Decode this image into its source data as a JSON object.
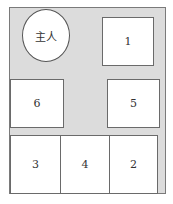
{
  "diagram": {
    "host_label": "主人",
    "seats": [
      {
        "id": "1",
        "label": "1"
      },
      {
        "id": "2",
        "label": "2"
      },
      {
        "id": "3",
        "label": "3"
      },
      {
        "id": "4",
        "label": "4"
      },
      {
        "id": "5",
        "label": "5"
      },
      {
        "id": "6",
        "label": "6"
      }
    ],
    "colors": {
      "floor": "#dcdcdc",
      "seat": "#ffffff",
      "border": "#6a6a6a"
    }
  }
}
